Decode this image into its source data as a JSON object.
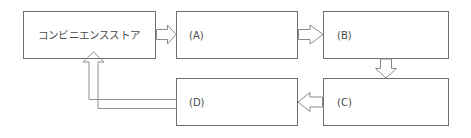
{
  "diagram": {
    "title": "",
    "background_color": "#ffffff",
    "line_color": "#6e6e6e",
    "arrow_color": "#8a8a8a",
    "text_color": "#4a4a4a",
    "nodes": [
      {
        "id": "store",
        "label": "コンビニエンスストア",
        "x": 23,
        "y": 11,
        "width": 132,
        "height": 47,
        "text_align": "center"
      },
      {
        "id": "a",
        "label": "(A)",
        "x": 176,
        "y": 11,
        "width": 121,
        "height": 47,
        "text_align": "left"
      },
      {
        "id": "b",
        "label": "(B)",
        "x": 323,
        "y": 11,
        "width": 125,
        "height": 47,
        "text_align": "left"
      },
      {
        "id": "d",
        "label": "(D)",
        "x": 176,
        "y": 78,
        "width": 121,
        "height": 47,
        "text_align": "left"
      },
      {
        "id": "c",
        "label": "(C)",
        "x": 323,
        "y": 78,
        "width": 125,
        "height": 47,
        "text_align": "left"
      }
    ],
    "connections": [
      {
        "id": "store-to-a",
        "from": "store",
        "to": "a",
        "style": "block-arrow",
        "direction": "right"
      },
      {
        "id": "a-to-b",
        "from": "a",
        "to": "b",
        "style": "block-arrow",
        "direction": "right"
      },
      {
        "id": "b-to-c",
        "from": "b",
        "to": "c",
        "style": "block-arrow",
        "direction": "down"
      },
      {
        "id": "c-to-d",
        "from": "c",
        "to": "d",
        "style": "block-arrow",
        "direction": "left"
      },
      {
        "id": "d-to-store",
        "from": "d",
        "to": "store",
        "style": "thin-outline-arrow",
        "direction": "up"
      }
    ]
  }
}
